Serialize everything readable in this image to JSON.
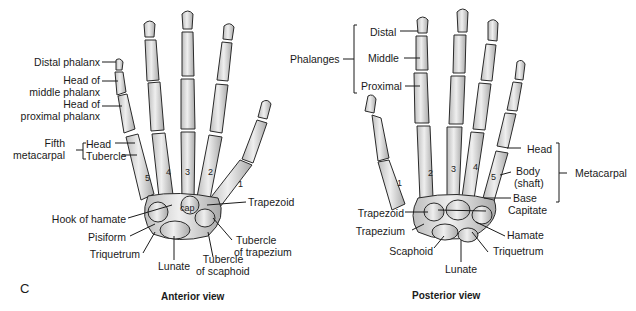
{
  "figure": {
    "panel_letter": "C",
    "anterior": {
      "caption": "Anterior view",
      "labels": {
        "distal_phalanx": "Distal phalanx",
        "head_middle_1": "Head of",
        "head_middle_2": "middle phalanx",
        "head_proximal_1": "Head of",
        "head_proximal_2": "proximal phalanx",
        "fifth_metacarpal_1": "Fifth",
        "fifth_metacarpal_2": "metacarpal",
        "head": "Head",
        "tubercle": "Tubercle",
        "hook_of_hamate": "Hook of hamate",
        "pisiform": "Pisiform",
        "triquetrum": "Triquetrum",
        "lunate": "Lunate",
        "tubercle_scaphoid_1": "Tubercle",
        "tubercle_scaphoid_2": "of scaphoid",
        "tubercle_trapezium_1": "Tubercle",
        "tubercle_trapezium_2": "of trapezium",
        "trapezoid": "Trapezoid",
        "cap": "cap"
      },
      "metacarpal_numbers": [
        "5",
        "4",
        "3",
        "2",
        "1"
      ]
    },
    "posterior": {
      "caption": "Posterior view",
      "labels": {
        "phalanges": "Phalanges",
        "distal": "Distal",
        "middle": "Middle",
        "proximal": "Proximal",
        "head": "Head",
        "body_1": "Body",
        "body_2": "(shaft)",
        "base": "Base",
        "metacarpal": "Metacarpal",
        "capitate": "Capitate",
        "hamate": "Hamate",
        "triquetrum": "Triquetrum",
        "lunate": "Lunate",
        "scaphoid": "Scaphoid",
        "trapezium": "Trapezium",
        "trapezoid": "Trapezoid"
      },
      "metacarpal_numbers": [
        "1",
        "2",
        "3",
        "4",
        "5"
      ]
    }
  }
}
